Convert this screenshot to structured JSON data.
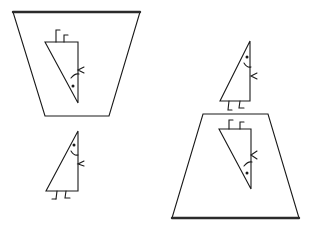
{
  "figure": {
    "stroke_color": "#1a1a1a",
    "background": "#ffffff",
    "panels": [
      {
        "name": "top-left-panel",
        "shape": "inverted-trapezoid",
        "thick_edge": "top",
        "contains": "upside-down triangle character"
      },
      {
        "name": "bottom-right-panel",
        "shape": "trapezoid",
        "thick_edge": "bottom",
        "contains": "upside-down triangle character"
      }
    ],
    "characters": [
      {
        "name": "reflected-character-top-left",
        "orientation": "inverted"
      },
      {
        "name": "standing-character-bottom-left",
        "orientation": "upright"
      },
      {
        "name": "standing-character-right",
        "orientation": "upright"
      },
      {
        "name": "reflected-character-bottom-right",
        "orientation": "inverted"
      }
    ]
  }
}
